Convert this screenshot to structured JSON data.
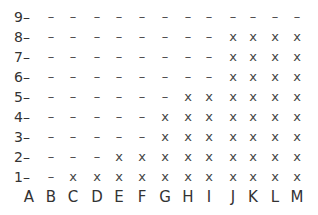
{
  "chart_data": {
    "type": "table",
    "title": "",
    "xlabel": "",
    "ylabel": "",
    "categories": [
      "A",
      "B",
      "C",
      "D",
      "E",
      "F",
      "G",
      "H",
      "I",
      "J",
      "K",
      "L",
      "M"
    ],
    "rows": [
      "9",
      "8",
      "7",
      "6",
      "5",
      "4",
      "3",
      "2",
      "1"
    ],
    "legend": {
      "x": "present",
      "-": "absent"
    },
    "grid": [
      [
        "-",
        "-",
        "-",
        "-",
        "-",
        "-",
        "-",
        "-",
        "-",
        "-",
        "-",
        "-",
        "-"
      ],
      [
        "-",
        "-",
        "-",
        "-",
        "-",
        "-",
        "-",
        "-",
        "-",
        "x",
        "x",
        "x",
        "x"
      ],
      [
        "-",
        "-",
        "-",
        "-",
        "-",
        "-",
        "-",
        "-",
        "-",
        "x",
        "x",
        "x",
        "x"
      ],
      [
        "-",
        "-",
        "-",
        "-",
        "-",
        "-",
        "-",
        "-",
        "-",
        "x",
        "x",
        "x",
        "x"
      ],
      [
        "-",
        "-",
        "-",
        "-",
        "-",
        "-",
        "-",
        "x",
        "x",
        "x",
        "x",
        "x",
        "x"
      ],
      [
        "-",
        "-",
        "-",
        "-",
        "-",
        "-",
        "x",
        "x",
        "x",
        "x",
        "x",
        "x",
        "x"
      ],
      [
        "-",
        "-",
        "-",
        "-",
        "-",
        "-",
        "x",
        "x",
        "x",
        "x",
        "x",
        "x",
        "x"
      ],
      [
        "-",
        "-",
        "-",
        "-",
        "x",
        "x",
        "x",
        "x",
        "x",
        "x",
        "x",
        "x",
        "x"
      ],
      [
        "-",
        "-",
        "x",
        "x",
        "x",
        "x",
        "x",
        "x",
        "x",
        "x",
        "x",
        "x",
        "x"
      ]
    ],
    "values_per_row_count_x": {
      "9": 0,
      "8": 4,
      "7": 4,
      "6": 4,
      "5": 6,
      "4": 7,
      "3": 7,
      "2": 9,
      "1": 11
    }
  }
}
